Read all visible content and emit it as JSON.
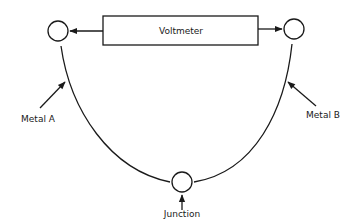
{
  "diagram": {
    "type": "thermocouple-circuit",
    "nodes": [
      {
        "id": "voltmeter",
        "label": "Voltmeter",
        "shape": "rectangle"
      },
      {
        "id": "terminal-a",
        "label": "",
        "shape": "circle"
      },
      {
        "id": "terminal-b",
        "label": "",
        "shape": "circle"
      },
      {
        "id": "junction",
        "label": "Junction",
        "shape": "circle"
      }
    ],
    "labels": {
      "voltmeter": "Voltmeter",
      "metal_a": "Metal A",
      "metal_b": "Metal B",
      "junction": "Junction"
    },
    "edges": [
      {
        "from": "voltmeter",
        "to": "terminal-a",
        "style": "arrow"
      },
      {
        "from": "voltmeter",
        "to": "terminal-b",
        "style": "arrow"
      },
      {
        "from": "terminal-a",
        "to": "junction",
        "style": "curve",
        "label": "Metal A"
      },
      {
        "from": "junction",
        "to": "terminal-b",
        "style": "curve",
        "label": "Metal B"
      }
    ],
    "colors": {
      "line": "#1a1a1a",
      "background": "#ffffff"
    }
  }
}
